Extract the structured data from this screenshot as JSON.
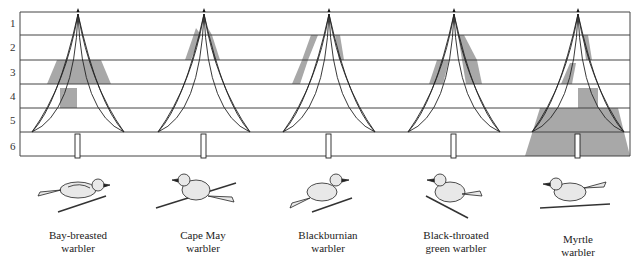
{
  "diagram": {
    "zones": [
      "1",
      "2",
      "3",
      "4",
      "5",
      "6"
    ],
    "shade_color": "#a8a8a8",
    "line_color": "#222222"
  },
  "species": [
    {
      "name": "Bay-breasted warbler",
      "line1": "Bay-breasted",
      "line2": "warbler",
      "zones_used": [
        "3",
        "4"
      ]
    },
    {
      "name": "Cape May warbler",
      "line1": "Cape May",
      "line2": "warbler",
      "zones_used": [
        "2"
      ]
    },
    {
      "name": "Blackburnian warbler",
      "line1": "Blackburnian",
      "line2": "warbler",
      "zones_used": [
        "2",
        "3"
      ]
    },
    {
      "name": "Black-throated green warbler",
      "line1": "Black-throated",
      "line2": "green warbler",
      "zones_used": [
        "2",
        "3"
      ]
    },
    {
      "name": "Myrtle warbler",
      "line1": "Myrtle",
      "line2": "warbler",
      "zones_used": [
        "3",
        "4",
        "5",
        "6"
      ]
    }
  ]
}
